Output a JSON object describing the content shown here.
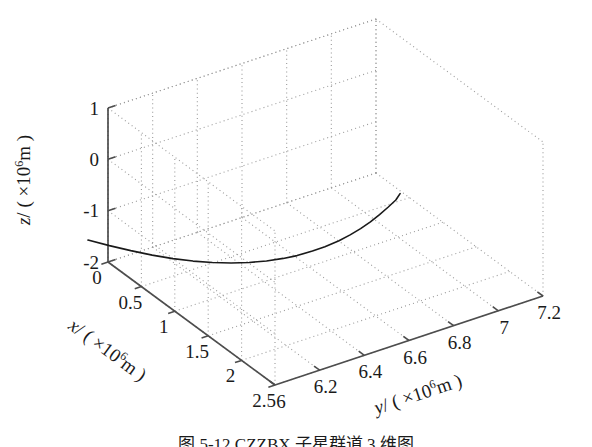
{
  "figure": {
    "caption": "图 5-12  CZZBX 子星群道 3 维图",
    "background": "#ffffff",
    "line_color": "#1a1a1a",
    "grid_color": "#9a9a9a",
    "axis_color": "#4d4d4d"
  },
  "chart_data": {
    "type": "line",
    "title": "",
    "projection": "3d",
    "xlabel": "x/ ( ×10⁶m )",
    "ylabel": "y/ ( ×10⁶m )",
    "zlabel": "z/ ( ×10⁶m )",
    "xlabel_parts": {
      "var": "x",
      "slash": "/",
      "open": "( ×10",
      "exp": "6",
      "unit": "m )"
    },
    "ylabel_parts": {
      "var": "y",
      "slash": "/",
      "open": "( ×10",
      "exp": "6",
      "unit": "m )"
    },
    "zlabel_parts": {
      "var": "z",
      "slash": "/",
      "open": "( ×10",
      "exp": "6",
      "unit": "m )"
    },
    "xlim": [
      0,
      2.5
    ],
    "ylim": [
      6,
      7.2
    ],
    "zlim": [
      -2,
      1
    ],
    "xticks": [
      0,
      0.5,
      1,
      1.5,
      2,
      2.5
    ],
    "yticks": [
      6,
      6.2,
      6.4,
      6.6,
      6.8,
      7,
      7.2
    ],
    "zticks": [
      -2,
      -1,
      0,
      1
    ],
    "xticklabels": [
      "0",
      "0.5",
      "1",
      "1.5",
      "2",
      "2.5"
    ],
    "yticklabels": [
      "6",
      "6.2",
      "6.4",
      "6.6",
      "6.8",
      "7",
      "7.2"
    ],
    "zticklabels": [
      "-2",
      "-1",
      "0",
      "1"
    ],
    "grid": true,
    "grid_style": "dotted",
    "legend": null,
    "series": [
      {
        "name": "orbit-trajectory",
        "color": "#1a1a1a",
        "width": 1.6,
        "points": [
          [
            2.5,
            6.56,
            0.92
          ],
          [
            2.47,
            6.55,
            0.78
          ],
          [
            2.42,
            6.53,
            0.62
          ],
          [
            2.36,
            6.51,
            0.45
          ],
          [
            2.29,
            6.49,
            0.27
          ],
          [
            2.21,
            6.47,
            0.09
          ],
          [
            2.12,
            6.45,
            -0.09
          ],
          [
            2.02,
            6.43,
            -0.27
          ],
          [
            1.91,
            6.4,
            -0.45
          ],
          [
            1.79,
            6.38,
            -0.62
          ],
          [
            1.66,
            6.35,
            -0.79
          ],
          [
            1.52,
            6.33,
            -0.95
          ],
          [
            1.37,
            6.3,
            -1.1
          ],
          [
            1.21,
            6.27,
            -1.24
          ],
          [
            1.04,
            6.24,
            -1.37
          ],
          [
            0.86,
            6.21,
            -1.49
          ],
          [
            0.67,
            6.18,
            -1.6
          ],
          [
            0.47,
            6.15,
            -1.7
          ],
          [
            0.26,
            6.12,
            -1.79
          ],
          [
            0.04,
            6.09,
            -1.87
          ],
          [
            -0.18,
            6.06,
            -1.94
          ],
          [
            -0.4,
            6.03,
            -2.0
          ]
        ]
      }
    ]
  }
}
